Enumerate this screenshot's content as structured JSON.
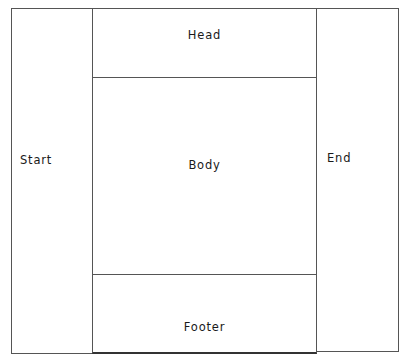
{
  "diagram": {
    "type": "page-layout-regions",
    "regions": {
      "start": {
        "label": "Start"
      },
      "head": {
        "label": "Head"
      },
      "body": {
        "label": "Body"
      },
      "footer": {
        "label": "Footer"
      },
      "end": {
        "label": "End"
      }
    },
    "colors": {
      "border": "#555555",
      "background": "#ffffff",
      "text": "#1a1a1a"
    }
  }
}
